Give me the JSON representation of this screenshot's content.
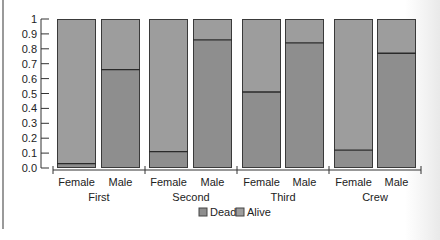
{
  "chart_data": {
    "type": "bar",
    "subtype": "stacked-100",
    "title": "",
    "xlabel": "",
    "ylabel": "",
    "ylim": [
      0,
      1
    ],
    "yticks": [
      "0.0",
      "0.1",
      "0.2",
      "0.3",
      "0.4",
      "0.5",
      "0.6",
      "0.7",
      "0.8",
      "0.9",
      "1"
    ],
    "grid": false,
    "groups": [
      "First",
      "Second",
      "Third",
      "Crew"
    ],
    "categories": [
      "Female",
      "Male",
      "Female",
      "Male",
      "Female",
      "Male",
      "Female",
      "Male"
    ],
    "series": [
      {
        "name": "Dead",
        "values": [
          0.03,
          0.66,
          0.11,
          0.86,
          0.51,
          0.84,
          0.12,
          0.77
        ]
      },
      {
        "name": "Alive",
        "values": [
          0.97,
          0.34,
          0.89,
          0.14,
          0.49,
          0.16,
          0.88,
          0.23
        ]
      }
    ],
    "legend": {
      "position": "bottom",
      "entries": [
        "Dead",
        "Alive"
      ]
    },
    "colors": {
      "dead": "#8e8e8e",
      "alive": "#9d9d9d",
      "outline": "#3a3a3a"
    }
  }
}
